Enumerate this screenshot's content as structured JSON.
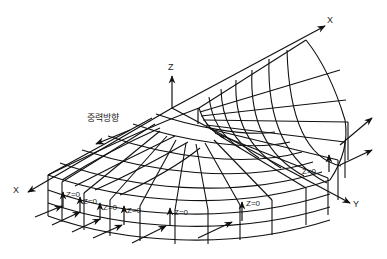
{
  "diagram": {
    "type": "semicircular annular finite element mesh with boundary conditions",
    "axes": {
      "z_label": "Z",
      "x_back_label": "X",
      "x_front_label": "X",
      "y_label": "Y"
    },
    "gravity_label": "중력방향",
    "boundary_labels": [
      "Z=0",
      "Z=0",
      "Z=0",
      "Z=0",
      "Z=0",
      "Z=0",
      "Z=0"
    ],
    "colors": {
      "line": "#111111",
      "background": "#ffffff"
    }
  }
}
